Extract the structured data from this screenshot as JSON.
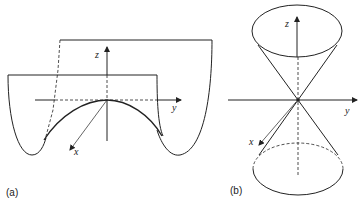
{
  "figure": {
    "panel_a": {
      "caption": "(a)",
      "axes": {
        "x": "x",
        "y": "y",
        "z": "z"
      },
      "description": "Saddle-shaped surface (hyperbolic paraboloid) with two vertical cross-section planes"
    },
    "panel_b": {
      "caption": "(b)",
      "axes": {
        "x": "x",
        "y": "y",
        "z": "z"
      },
      "description": "Double cone meeting at the origin"
    },
    "colors": {
      "stroke": "#222222",
      "background": "#ffffff"
    }
  }
}
